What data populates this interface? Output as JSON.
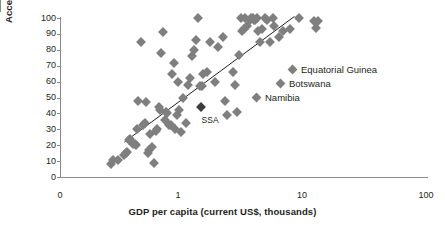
{
  "chart_data": {
    "type": "scatter",
    "title": "",
    "xlabel": "GDP per capita (current US$, thousands)",
    "ylabel": "Access to electricity (% of population)",
    "xscale": "log",
    "xticks": [
      "0",
      "1",
      "10",
      "100"
    ],
    "xtick_values": [
      0,
      1,
      10,
      100
    ],
    "yticks": [
      "0",
      "10",
      "20",
      "30",
      "40",
      "50",
      "60",
      "70",
      "80",
      "90",
      "100"
    ],
    "ylim": [
      0,
      100
    ],
    "grid": false,
    "legend_position": "inside-right",
    "series": [
      {
        "name": "Countries",
        "color": "#7f7f7f",
        "marker": "diamond",
        "points": [
          {
            "x": 0.29,
            "y": 8
          },
          {
            "x": 0.3,
            "y": 11
          },
          {
            "x": 0.33,
            "y": 11
          },
          {
            "x": 0.37,
            "y": 14
          },
          {
            "x": 0.38,
            "y": 15
          },
          {
            "x": 0.39,
            "y": 16
          },
          {
            "x": 0.4,
            "y": 23
          },
          {
            "x": 0.41,
            "y": 24
          },
          {
            "x": 0.43,
            "y": 21
          },
          {
            "x": 0.45,
            "y": 21
          },
          {
            "x": 0.46,
            "y": 20
          },
          {
            "x": 0.47,
            "y": 30
          },
          {
            "x": 0.48,
            "y": 48
          },
          {
            "x": 0.5,
            "y": 85
          },
          {
            "x": 0.52,
            "y": 33
          },
          {
            "x": 0.54,
            "y": 34
          },
          {
            "x": 0.55,
            "y": 47
          },
          {
            "x": 0.57,
            "y": 15
          },
          {
            "x": 0.58,
            "y": 17
          },
          {
            "x": 0.6,
            "y": 27
          },
          {
            "x": 0.62,
            "y": 19
          },
          {
            "x": 0.64,
            "y": 9
          },
          {
            "x": 0.66,
            "y": 29
          },
          {
            "x": 0.68,
            "y": 30
          },
          {
            "x": 0.7,
            "y": 44
          },
          {
            "x": 0.72,
            "y": 42
          },
          {
            "x": 0.73,
            "y": 78
          },
          {
            "x": 0.75,
            "y": 91
          },
          {
            "x": 0.78,
            "y": 36
          },
          {
            "x": 0.8,
            "y": 41
          },
          {
            "x": 0.82,
            "y": 40
          },
          {
            "x": 0.85,
            "y": 33
          },
          {
            "x": 0.88,
            "y": 33
          },
          {
            "x": 0.9,
            "y": 65
          },
          {
            "x": 0.92,
            "y": 72
          },
          {
            "x": 0.95,
            "y": 30
          },
          {
            "x": 0.98,
            "y": 39
          },
          {
            "x": 1.0,
            "y": 60
          },
          {
            "x": 1.02,
            "y": 42
          },
          {
            "x": 1.05,
            "y": 28
          },
          {
            "x": 1.1,
            "y": 50
          },
          {
            "x": 1.15,
            "y": 34
          },
          {
            "x": 1.2,
            "y": 58
          },
          {
            "x": 1.25,
            "y": 62
          },
          {
            "x": 1.3,
            "y": 76
          },
          {
            "x": 1.35,
            "y": 80
          },
          {
            "x": 1.4,
            "y": 86
          },
          {
            "x": 1.45,
            "y": 100
          },
          {
            "x": 1.5,
            "y": 57
          },
          {
            "x": 1.55,
            "y": 57
          },
          {
            "x": 1.6,
            "y": 65
          },
          {
            "x": 1.7,
            "y": 66
          },
          {
            "x": 1.8,
            "y": 85
          },
          {
            "x": 2.0,
            "y": 60
          },
          {
            "x": 2.1,
            "y": 82
          },
          {
            "x": 2.3,
            "y": 88
          },
          {
            "x": 2.4,
            "y": 48
          },
          {
            "x": 2.5,
            "y": 39
          },
          {
            "x": 2.8,
            "y": 66
          },
          {
            "x": 2.9,
            "y": 58
          },
          {
            "x": 3.0,
            "y": 41
          },
          {
            "x": 3.1,
            "y": 77
          },
          {
            "x": 3.2,
            "y": 100
          },
          {
            "x": 3.3,
            "y": 92
          },
          {
            "x": 3.4,
            "y": 93
          },
          {
            "x": 3.5,
            "y": 100
          },
          {
            "x": 3.6,
            "y": 95
          },
          {
            "x": 3.8,
            "y": 99
          },
          {
            "x": 3.9,
            "y": 100
          },
          {
            "x": 4.0,
            "y": 100
          },
          {
            "x": 4.1,
            "y": 99
          },
          {
            "x": 4.2,
            "y": 99
          },
          {
            "x": 4.3,
            "y": 100
          },
          {
            "x": 4.4,
            "y": 92
          },
          {
            "x": 4.6,
            "y": 85
          },
          {
            "x": 4.8,
            "y": 93
          },
          {
            "x": 5.0,
            "y": 100
          },
          {
            "x": 5.2,
            "y": 99
          },
          {
            "x": 5.5,
            "y": 85
          },
          {
            "x": 5.8,
            "y": 100
          },
          {
            "x": 6.0,
            "y": 95
          },
          {
            "x": 6.5,
            "y": 88
          },
          {
            "x": 7.0,
            "y": 92
          },
          {
            "x": 8.0,
            "y": 93
          },
          {
            "x": 9.5,
            "y": 100
          },
          {
            "x": 12.5,
            "y": 98
          },
          {
            "x": 13.0,
            "y": 94
          },
          {
            "x": 13.5,
            "y": 98
          }
        ]
      },
      {
        "name": "SSA",
        "color": "#3b3b3b",
        "marker": "diamond",
        "points": [
          {
            "x": 1.52,
            "y": 44
          }
        ]
      }
    ],
    "trendline": {
      "x0": 0.37,
      "y0": 22,
      "x1": 8.7,
      "y1": 101
    },
    "annotations": [
      {
        "text": "SSA",
        "x": 1.55,
        "y": 36
      }
    ],
    "legend": [
      {
        "label": "Equatorial Guinea",
        "color": "#7f7f7f"
      },
      {
        "label": "Botswana",
        "color": "#7f7f7f"
      },
      {
        "label": "Namibia",
        "color": "#7f7f7f"
      }
    ]
  }
}
